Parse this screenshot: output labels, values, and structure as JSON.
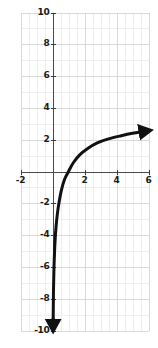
{
  "chart_data": {
    "type": "line",
    "title": "",
    "xlabel": "",
    "ylabel": "",
    "xlim": [
      -2,
      6
    ],
    "ylim": [
      -10,
      10
    ],
    "grid": true,
    "grid_major_step_x": 2,
    "grid_major_step_y": 2,
    "grid_minor_step_x": 0.5,
    "grid_minor_step_y": 1,
    "legend": "none",
    "x_ticks": [
      -2,
      2,
      4,
      6
    ],
    "x_tick_labels": [
      "-2",
      "2",
      "4",
      "6"
    ],
    "y_ticks": [
      -10,
      -8,
      -6,
      -4,
      -2,
      2,
      4,
      6,
      8,
      10
    ],
    "y_tick_labels": [
      "-10",
      "-8",
      "-6",
      "-4",
      "-2",
      "2",
      "4",
      "6",
      "8",
      "10"
    ],
    "series": [
      {
        "name": "logarithmic-curve",
        "color": "#111111",
        "line_width": 3,
        "arrow_start": "down",
        "arrow_end": "right",
        "asymptote_x": 0,
        "points": [
          {
            "x": 0.04,
            "y": -9.5
          },
          {
            "x": 0.05,
            "y": -8.5
          },
          {
            "x": 0.06,
            "y": -7.6
          },
          {
            "x": 0.08,
            "y": -6.6
          },
          {
            "x": 0.1,
            "y": -5.8
          },
          {
            "x": 0.13,
            "y": -5.0
          },
          {
            "x": 0.17,
            "y": -4.2
          },
          {
            "x": 0.22,
            "y": -3.5
          },
          {
            "x": 0.3,
            "y": -2.7
          },
          {
            "x": 0.4,
            "y": -2.0
          },
          {
            "x": 0.55,
            "y": -1.2
          },
          {
            "x": 0.75,
            "y": -0.5
          },
          {
            "x": 1.0,
            "y": 0.0
          },
          {
            "x": 1.3,
            "y": 0.55
          },
          {
            "x": 1.7,
            "y": 1.05
          },
          {
            "x": 2.2,
            "y": 1.45
          },
          {
            "x": 2.8,
            "y": 1.8
          },
          {
            "x": 3.5,
            "y": 2.05
          },
          {
            "x": 4.3,
            "y": 2.25
          },
          {
            "x": 5.0,
            "y": 2.4
          },
          {
            "x": 5.6,
            "y": 2.5
          }
        ]
      }
    ],
    "axis_color": "#4a4a4a",
    "grid_major_color": "#d9d9d9",
    "grid_minor_color": "#eeeeee",
    "label_color": "#1a1a1a"
  },
  "axes": {
    "x_axis_name": "x-axis",
    "y_axis_name": "y-axis"
  }
}
